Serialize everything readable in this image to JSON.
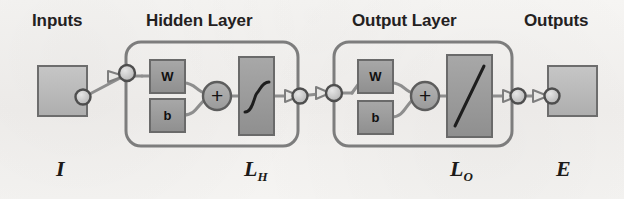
{
  "diagram": {
    "title_labels": {
      "inputs": "Inputs",
      "hidden_layer": "Hidden Layer",
      "output_layer": "Output Layer",
      "outputs": "Outputs"
    },
    "bottom_labels": {
      "input_symbol": "I",
      "hidden_symbol_base": "L",
      "hidden_symbol_sub": "H",
      "output_symbol_base": "L",
      "output_symbol_sub": "O",
      "error_symbol": "E"
    },
    "hidden_layer": {
      "weight_label": "W",
      "bias_label": "b",
      "sum_label": "+",
      "activation": "sigmoid"
    },
    "output_layer": {
      "weight_label": "W",
      "bias_label": "b",
      "sum_label": "+",
      "activation": "linear"
    },
    "colors": {
      "background": "#f4f3f1",
      "block_fill": "#9a9a9a",
      "io_fill": "#b9b9b9",
      "outline": "#5d5d5d",
      "wire": "#8e8e8e",
      "text": "#1c1a18"
    }
  }
}
